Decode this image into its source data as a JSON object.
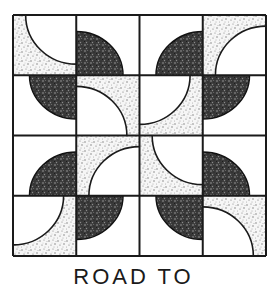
{
  "figure": {
    "type": "quilt-block-illustration",
    "grid": {
      "rows": 4,
      "cols": 4
    },
    "colors": {
      "background": "#ffffff",
      "line": "#1a1a1a",
      "dark_fill": "#3b3b3b",
      "stipple_base": "#f6f6f6",
      "stipple_dot": "#6e6e6e"
    },
    "tiles": [
      [
        {
          "style": "light",
          "corner": "top-right"
        },
        {
          "style": "dark",
          "corner": "bottom-left"
        },
        {
          "style": "dark",
          "corner": "bottom-right"
        },
        {
          "style": "light",
          "corner": "bottom-right"
        }
      ],
      [
        {
          "style": "dark",
          "corner": "top-right"
        },
        {
          "style": "light",
          "corner": "bottom-left"
        },
        {
          "style": "light",
          "corner": "top-left"
        },
        {
          "style": "dark",
          "corner": "top-left"
        }
      ],
      [
        {
          "style": "dark",
          "corner": "bottom-right"
        },
        {
          "style": "light",
          "corner": "bottom-right"
        },
        {
          "style": "light",
          "corner": "top-right"
        },
        {
          "style": "dark",
          "corner": "bottom-left"
        }
      ],
      [
        {
          "style": "light",
          "corner": "top-left"
        },
        {
          "style": "dark",
          "corner": "top-left"
        },
        {
          "style": "dark",
          "corner": "top-right"
        },
        {
          "style": "light",
          "corner": "bottom-left"
        }
      ]
    ]
  },
  "caption": "ROAD TO"
}
